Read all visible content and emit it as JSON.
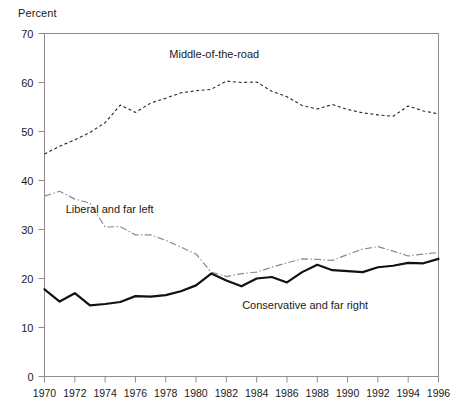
{
  "chart_data": {
    "type": "line",
    "title": "",
    "ylabel": "Percent",
    "xlabel": "",
    "ylim": [
      0,
      70
    ],
    "xlim": [
      1970,
      1996
    ],
    "grid": false,
    "legend_position": "inline-annotations",
    "ytick_labels": [
      "0",
      "10",
      "20",
      "30",
      "40",
      "50",
      "60",
      "70"
    ],
    "ytick_values": [
      0,
      10,
      20,
      30,
      40,
      50,
      60,
      70
    ],
    "xtick_labels": [
      "1970",
      "1972",
      "1974",
      "1976",
      "1978",
      "1980",
      "1982",
      "1984",
      "1986",
      "1988",
      "1990",
      "1992",
      "1994",
      "1996"
    ],
    "xtick_values": [
      1970,
      1972,
      1974,
      1976,
      1978,
      1980,
      1982,
      1984,
      1986,
      1988,
      1990,
      1992,
      1994,
      1996
    ],
    "x": [
      1970,
      1971,
      1972,
      1973,
      1974,
      1975,
      1976,
      1977,
      1978,
      1979,
      1980,
      1981,
      1982,
      1983,
      1984,
      1985,
      1986,
      1987,
      1988,
      1989,
      1990,
      1991,
      1992,
      1993,
      1994,
      1995,
      1996
    ],
    "series": [
      {
        "name": "Middle-of-the-road",
        "style": "dashed",
        "color": "#262626",
        "label_x": 1981.2,
        "label_y": 65.0,
        "values": [
          45.4,
          47.0,
          48.3,
          49.8,
          51.8,
          55.4,
          53.9,
          55.8,
          56.8,
          57.9,
          58.3,
          58.6,
          60.3,
          60.0,
          60.1,
          58.2,
          57.1,
          55.3,
          54.6,
          55.5,
          54.5,
          53.8,
          53.4,
          53.1,
          55.2,
          54.2,
          53.6
        ]
      },
      {
        "name": "Liberal and far left",
        "style": "dash-dot",
        "color": "#8a8a8a",
        "label_x": 1974.3,
        "label_y": 33.3,
        "values": [
          36.8,
          37.8,
          36.2,
          35.4,
          30.5,
          30.6,
          28.9,
          28.9,
          27.8,
          26.4,
          25.0,
          21.3,
          20.4,
          21.0,
          21.3,
          22.3,
          23.2,
          24.0,
          23.9,
          23.7,
          24.9,
          26.0,
          26.5,
          25.6,
          24.6,
          25.0,
          25.3
        ]
      },
      {
        "name": "Conservative and far right",
        "style": "solid",
        "color": "#111111",
        "label_x": 1987.2,
        "label_y": 13.8,
        "values": [
          17.8,
          15.3,
          17.0,
          14.5,
          14.8,
          15.2,
          16.4,
          16.3,
          16.6,
          17.4,
          18.6,
          21.0,
          19.6,
          18.4,
          20.0,
          20.3,
          19.2,
          21.3,
          22.8,
          21.7,
          21.5,
          21.3,
          22.3,
          22.6,
          23.2,
          23.1,
          24.0
        ]
      }
    ]
  },
  "labels": {
    "axis_title": "Percent",
    "series_middle": "Middle-of-the-road",
    "series_liberal": "Liberal and far left",
    "series_conservative": "Conservative and far right"
  }
}
